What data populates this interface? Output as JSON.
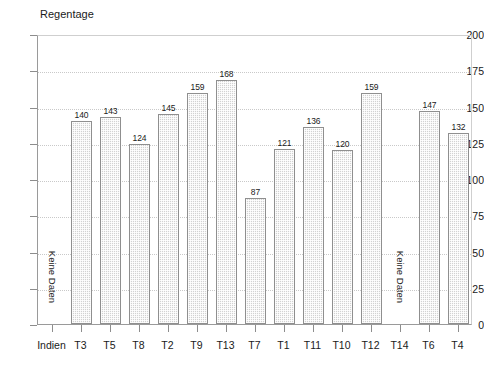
{
  "chart_data": {
    "type": "bar",
    "title": "",
    "ylabel": "Regentage",
    "xlabel": "",
    "ylim": [
      0,
      200
    ],
    "yticks": [
      0,
      25,
      50,
      75,
      100,
      125,
      150,
      175,
      200
    ],
    "grid": true,
    "legend": null,
    "categories": [
      "Indien",
      "T3",
      "T5",
      "T8",
      "T2",
      "T9",
      "T13",
      "T7",
      "T1",
      "T11",
      "T10",
      "T12",
      "T14",
      "T6",
      "T4"
    ],
    "values": [
      null,
      140,
      143,
      124,
      145,
      159,
      168,
      87,
      121,
      136,
      120,
      159,
      null,
      147,
      132
    ],
    "value_labels": [
      "",
      "140",
      "143",
      "124",
      "145",
      "159",
      "168",
      "87",
      "121",
      "136",
      "120",
      "159",
      "",
      "147",
      "132"
    ],
    "missing_label": "Keine Daten",
    "missing_categories": [
      "Indien",
      "T14"
    ],
    "annotations": [
      "Keine Daten",
      "Keine Daten"
    ],
    "bar_fill_color": "#d2d2d2",
    "bar_border_color": "#8f8f8f",
    "axis_color": "#8d8d8d",
    "grid_color": "#c9c9c9",
    "text_color": "#1a1a1a"
  }
}
